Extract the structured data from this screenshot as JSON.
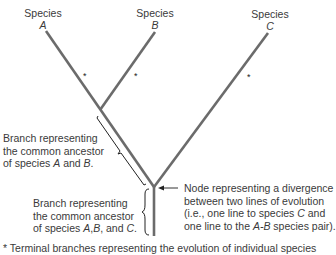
{
  "species": [
    {
      "prefix": "Species",
      "letter": "A"
    },
    {
      "prefix": "Species",
      "letter": "B"
    },
    {
      "prefix": "Species",
      "letter": "C"
    }
  ],
  "terminal_marker": "*",
  "annotations": {
    "ab_branch": {
      "line1": "Branch representing",
      "line2": "the common ancestor",
      "line3_pre": "of species ",
      "line3_a": "A",
      "line3_mid": " and ",
      "line3_b": "B",
      "line3_post": "."
    },
    "abc_branch": {
      "line1": "Branch representing",
      "line2": "the common ancestor",
      "line3_pre": "of species ",
      "line3_a": "A",
      "line3_sep": ",",
      "line3_b": "B",
      "line3_mid": ", and ",
      "line3_c": "C",
      "line3_post": "."
    },
    "node": {
      "line1": "Node representing a divergence",
      "line2": "between two lines of evolution",
      "line3_pre": "(i.e., one line to species ",
      "line3_c": "C",
      "line3_post": " and",
      "line4_pre": "one line to the ",
      "line4_ab": "A-B",
      "line4_post": " species pair)."
    }
  },
  "footnote": "* Terminal branches representing the evolution of individual species",
  "colors": {
    "branch": "#6b6b6b",
    "text": "#3a3a3a",
    "bracket": "#222222"
  }
}
